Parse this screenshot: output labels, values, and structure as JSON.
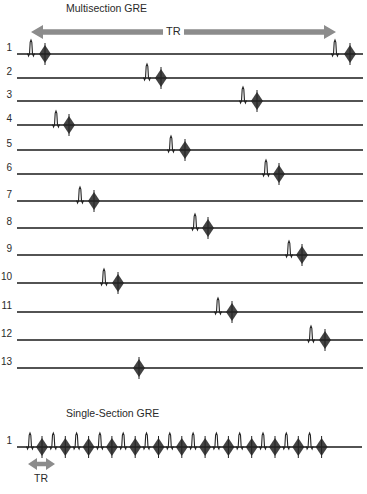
{
  "multisection": {
    "title": "Multisection GRE",
    "tr_label": "TR",
    "tr_arrow": {
      "x1": 31,
      "x2": 336,
      "y": 32
    },
    "line_x_start": 17,
    "line_x_end": 363,
    "rows": [
      {
        "label": "1",
        "y": 54,
        "pulses": [
          31,
          335
        ],
        "echoes": [
          45,
          350
        ]
      },
      {
        "label": "2",
        "y": 78,
        "pulses": [
          147
        ],
        "echoes": [
          161
        ]
      },
      {
        "label": "3",
        "y": 101,
        "pulses": [
          243
        ],
        "echoes": [
          257
        ]
      },
      {
        "label": "4",
        "y": 125,
        "pulses": [
          56
        ],
        "echoes": [
          69
        ]
      },
      {
        "label": "5",
        "y": 150,
        "pulses": [
          171
        ],
        "echoes": [
          185
        ]
      },
      {
        "label": "6",
        "y": 174,
        "pulses": [
          266
        ],
        "echoes": [
          279
        ]
      },
      {
        "label": "7",
        "y": 201,
        "pulses": [
          80
        ],
        "echoes": [
          94
        ]
      },
      {
        "label": "8",
        "y": 228,
        "pulses": [
          195
        ],
        "echoes": [
          208
        ]
      },
      {
        "label": "9",
        "y": 255,
        "pulses": [
          289
        ],
        "echoes": [
          302
        ]
      },
      {
        "label": "10",
        "y": 283,
        "pulses": [
          104
        ],
        "echoes": [
          118
        ]
      },
      {
        "label": "11",
        "y": 312,
        "pulses": [
          218
        ],
        "echoes": [
          232
        ]
      },
      {
        "label": "12",
        "y": 340,
        "pulses": [
          311
        ],
        "echoes": [
          325
        ]
      },
      {
        "label": "13",
        "y": 368,
        "pulses": [],
        "echoes": [
          139
        ]
      }
    ]
  },
  "single_section": {
    "title": "Single-Section GRE",
    "tr_label": "TR",
    "row": {
      "label": "1",
      "y": 447,
      "line_x_start": 17,
      "line_x_end": 362,
      "pulse_start": 30,
      "pulse_spacing": 23.3,
      "pulse_count": 13,
      "echo_offset": 12
    },
    "tr_arrow": {
      "x1": 28,
      "x2": 55,
      "y": 464
    }
  },
  "colors": {
    "line": "#1a1a1a",
    "arrow": "#8c8c8c",
    "signal": "#222222"
  }
}
